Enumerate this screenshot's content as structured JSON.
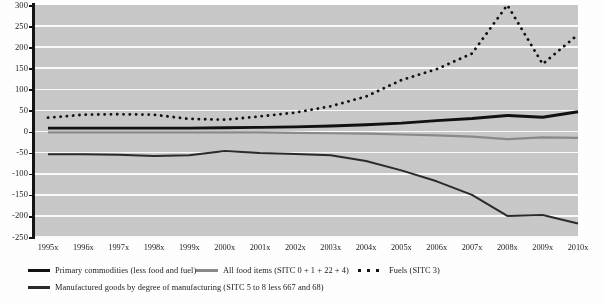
{
  "chart_data": {
    "type": "line",
    "title": "",
    "subtitle": "",
    "xlabel": "",
    "ylabel": "",
    "grid": true,
    "legend_position": "bottom",
    "ylim": [
      -250,
      300
    ],
    "ytick_step": 50,
    "yticks": [
      "300",
      "250",
      "200",
      "150",
      "100",
      "50",
      "0",
      "-50",
      "-100",
      "-150",
      "-200",
      "-250"
    ],
    "categories": [
      "1995x",
      "1996x",
      "1997x",
      "1998x",
      "1999x",
      "2000x",
      "2001x",
      "2002x",
      "2003x",
      "2004x",
      "2005x",
      "2006x",
      "2007x",
      "2008x",
      "2009x",
      "2010x"
    ],
    "series": [
      {
        "name": "Primary commodities (less food and fuel)",
        "style": "solid-thick-black",
        "color": "#111111",
        "values": [
          8,
          8,
          8,
          8,
          8,
          9,
          10,
          11,
          13,
          16,
          20,
          26,
          31,
          38,
          34,
          47
        ]
      },
      {
        "name": "All food items (SITC 0 + 1 + 22 + 4)",
        "style": "solid-medium-gray",
        "color": "#8a8a8a",
        "values": [
          -2,
          -2,
          -2,
          -2,
          -2,
          -2,
          -2,
          -3,
          -4,
          -5,
          -7,
          -9,
          -12,
          -18,
          -14,
          -15
        ]
      },
      {
        "name": "Fuels (SITC 3)",
        "style": "dotted-black",
        "color": "#111111",
        "values": [
          33,
          40,
          41,
          40,
          30,
          28,
          36,
          45,
          60,
          83,
          122,
          148,
          185,
          300,
          160,
          230
        ]
      },
      {
        "name": "Manufactured goods by degree of manufacturing (SITC 5 to 8 less 667 and 68)",
        "style": "solid-thin-dark",
        "color": "#2a2a2a",
        "values": [
          -54,
          -54,
          -55,
          -58,
          -56,
          -46,
          -51,
          -53,
          -56,
          -70,
          -92,
          -118,
          -150,
          -200,
          -198,
          -218
        ]
      }
    ]
  },
  "legend": {
    "items": [
      {
        "label": "Primary commodities (less food and fuel)",
        "swatch": "solid-thick-black"
      },
      {
        "label": "All food items (SITC 0 + 1 + 22 + 4)",
        "swatch": "solid-medium-gray"
      },
      {
        "label": "Fuels (SITC 3)",
        "swatch": "dotted-black"
      },
      {
        "label": "Manufactured goods by degree of manufacturing (SITC 5 to 8 less 667 and 68)",
        "swatch": "solid-thin-dark"
      }
    ]
  },
  "colors": {
    "plot_background": "#c9c9c9",
    "gridline": "#fbfbfb",
    "axis": "#141414",
    "page_background": "#ffffff"
  }
}
